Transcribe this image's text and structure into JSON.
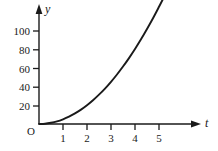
{
  "chart_data": {
    "type": "line",
    "title": "",
    "xlabel": "t",
    "ylabel": "y",
    "origin_label": "O",
    "grid": false,
    "legend": null,
    "xlim": [
      0,
      6.6
    ],
    "ylim": [
      0,
      133
    ],
    "xticks": [
      1,
      2,
      3,
      4,
      5
    ],
    "xtick_labels": [
      "1",
      "2",
      "3",
      "4",
      "5"
    ],
    "yticks": [
      20,
      40,
      60,
      80,
      100
    ],
    "ytick_labels": [
      "20",
      "40",
      "60",
      "80",
      "100"
    ],
    "series": [
      {
        "name": "curve",
        "color": "#1a1a1a",
        "x": [
          0,
          0.25,
          0.5,
          0.75,
          1,
          1.25,
          1.5,
          1.75,
          2,
          2.25,
          2.5,
          2.75,
          3,
          3.25,
          3.5,
          3.75,
          4,
          4.25,
          4.5,
          4.75,
          5,
          5.2
        ],
        "y": [
          0,
          0.3,
          1.3,
          2.8,
          5,
          7.8,
          11.3,
          15.3,
          20,
          25.3,
          31.3,
          37.8,
          45,
          52.8,
          61.3,
          70.3,
          80,
          90.3,
          101.3,
          112.8,
          125,
          135
        ]
      }
    ],
    "axis_color": "#1a1a1a",
    "background_color": "#ffffff"
  },
  "figure": {
    "axis_y_name": "y",
    "axis_x_name": "t"
  }
}
